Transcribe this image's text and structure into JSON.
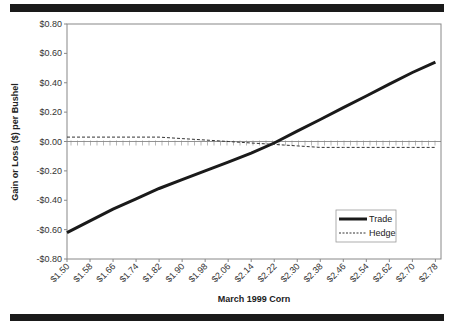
{
  "chart_data": {
    "type": "line",
    "title": "",
    "xlabel": "March 1999 Corn",
    "ylabel": "Gain or Loss ($) per Bushel",
    "ylim": [
      -0.8,
      0.8
    ],
    "y_ticks": [
      "$0.80",
      "$0.60",
      "$0.40",
      "$0.20",
      "$0.00",
      "-$0.20",
      "-$0.40",
      "-$0.60",
      "-$0.80"
    ],
    "categories": [
      "$1.50",
      "$1.58",
      "$1.66",
      "$1.74",
      "$1.82",
      "$1.90",
      "$1.98",
      "$2.06",
      "$2.14",
      "$2.22",
      "$2.30",
      "$2.38",
      "$2.46",
      "$2.54",
      "$2.62",
      "$2.70",
      "$2.78"
    ],
    "x_values": [
      1.5,
      1.58,
      1.66,
      1.74,
      1.82,
      1.9,
      1.98,
      2.06,
      2.14,
      2.22,
      2.3,
      2.38,
      2.46,
      2.54,
      2.62,
      2.7,
      2.78
    ],
    "series": [
      {
        "name": "Trade",
        "style": "solid-thick",
        "color": "#1a1a1a",
        "values": [
          -0.62,
          -0.54,
          -0.46,
          -0.39,
          -0.32,
          -0.26,
          -0.2,
          -0.14,
          -0.08,
          -0.01,
          0.07,
          0.15,
          0.23,
          0.31,
          0.39,
          0.47,
          0.54
        ]
      },
      {
        "name": "Hedge",
        "style": "dashed",
        "color": "#333333",
        "values": [
          0.03,
          0.03,
          0.03,
          0.03,
          0.03,
          0.02,
          0.01,
          0.0,
          -0.01,
          -0.02,
          -0.03,
          -0.04,
          -0.04,
          -0.04,
          -0.04,
          -0.04,
          -0.04
        ]
      }
    ],
    "grid": false,
    "legend_position": "lower-right-inside"
  },
  "legend": {
    "trade": "Trade",
    "hedge": "Hedge"
  }
}
